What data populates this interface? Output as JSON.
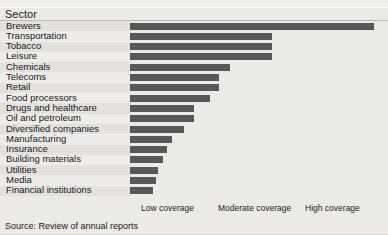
{
  "header": {
    "column_title": "Sector",
    "cropped_top_text": ""
  },
  "source_note": "Source: Review of annual reports",
  "axis": {
    "tick_labels": [
      "Low coverage",
      "Moderate coverage",
      "High coverage"
    ]
  },
  "colors": {
    "bar": "#58585a",
    "background": "#eceae7",
    "row_stripe": "#e4e1dd",
    "row_stripe_alt": "#eeecea",
    "rule": "#bdbab6",
    "text": "#17181a"
  },
  "chart_data": {
    "type": "bar",
    "orientation": "horizontal",
    "title": "",
    "subtitle": "",
    "xlabel": "",
    "ylabel": "Sector",
    "categories": [
      "Brewers",
      "Transportation",
      "Tobacco",
      "Leisure",
      "Chemicals",
      "Telecoms",
      "Retail",
      "Food processors",
      "Drugs and healthcare",
      "Oil and petroleum",
      "Diversified companies",
      "Manufacturing",
      "Insurance",
      "Building materials",
      "Utilities",
      "Media",
      "Financial institutions"
    ],
    "values": [
      95.3,
      55.5,
      55.5,
      55.5,
      39.1,
      34.8,
      34.8,
      31.3,
      25.0,
      25.0,
      21.1,
      16.4,
      14.5,
      12.9,
      10.9,
      10.2,
      9.0
    ],
    "value_unit": "percent of plot width",
    "xlim": [
      0,
      100
    ],
    "xtick_positions": [
      8,
      41,
      75
    ],
    "xtick_labels": [
      "Low coverage",
      "Moderate coverage",
      "High coverage"
    ],
    "grid": false,
    "legend": "none"
  }
}
